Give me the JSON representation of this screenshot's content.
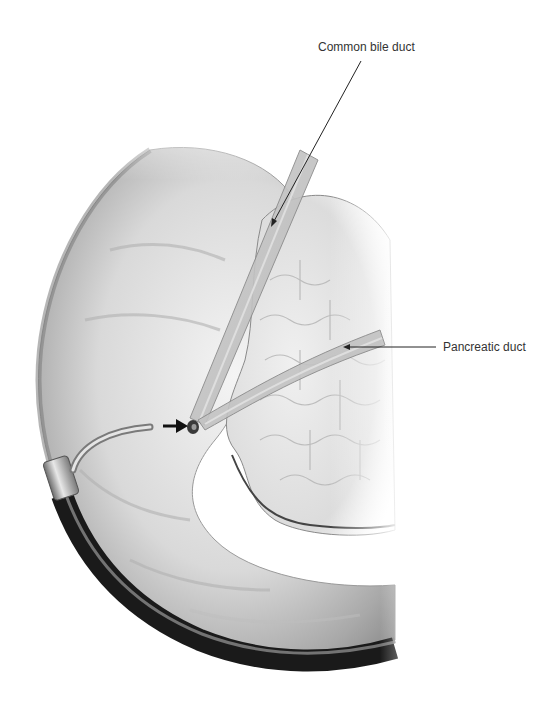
{
  "figure": {
    "background": "#ffffff"
  },
  "labels": [
    {
      "id": "cbd",
      "text": "Common bile duct",
      "x": 318,
      "y": 40
    },
    {
      "id": "pd",
      "text": "Pancreatic duct",
      "x": 443,
      "y": 340
    }
  ],
  "leader_lines": [
    {
      "label": "cbd",
      "from": [
        361,
        61
      ],
      "to": [
        271,
        226
      ]
    },
    {
      "label": "pd",
      "from": [
        436,
        347
      ],
      "to": [
        344,
        347
      ]
    }
  ],
  "annotations": {
    "papilla_arrow": {
      "from": [
        163,
        426
      ],
      "to": [
        186,
        426
      ]
    }
  },
  "colors": {
    "text": "#333333",
    "line": "#222222",
    "duodenum_light": "#f2f2f2",
    "duodenum_mid": "#bdbdbd",
    "duodenum_dark": "#6e6e6e",
    "scope_black": "#1a1a1a",
    "pancreas": "#e6e6e6"
  }
}
